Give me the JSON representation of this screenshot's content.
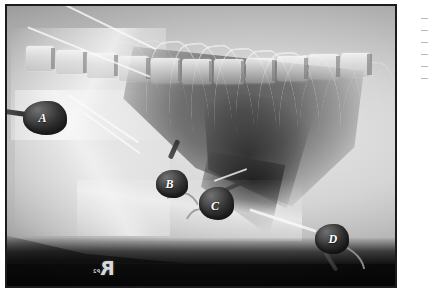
{
  "figure": {
    "kind": "radiograph",
    "modality": "x-ray",
    "view": "right lateral thorax",
    "species_hint": "canine"
  },
  "frame": {
    "border_color": "#1c1c1c",
    "page_background": "#ffffff"
  },
  "film": {
    "background_color": "#070707",
    "soft_tissue_color": "#c8c8c8",
    "lung_color": "#4a4a4a",
    "bone_color": "#f6f6f6"
  },
  "laterality_marker": {
    "letter": "R",
    "sub_text": "P2",
    "mirrored": true,
    "color": "#d8d8d8"
  },
  "annotations": [
    {
      "id": "marker-a",
      "letter": "A",
      "left_pct": 4.0,
      "top_pct": 34.0,
      "blob_w": 44,
      "blob_h": 34,
      "glyph_left": 16,
      "glyph_top": 11,
      "tail_left": -18,
      "tail_top": 8,
      "tail_w": 22,
      "tail_h": 5,
      "tail_rot": 8
    },
    {
      "id": "marker-b",
      "letter": "B",
      "left_pct": 38.5,
      "top_pct": 58.5,
      "blob_w": 32,
      "blob_h": 28,
      "glyph_left": 9,
      "glyph_top": 8,
      "tail_left": 14,
      "tail_top": -14,
      "tail_w": 20,
      "tail_h": 5,
      "tail_rot": -66
    },
    {
      "id": "marker-c",
      "letter": "C",
      "left_pct": 49.5,
      "top_pct": 64.5,
      "blob_w": 35,
      "blob_h": 33,
      "glyph_left": 12,
      "glyph_top": 13,
      "tail_left": 24,
      "tail_top": 2,
      "tail_w": 26,
      "tail_h": 4,
      "tail_rot": -24
    },
    {
      "id": "marker-d",
      "letter": "D",
      "left_pct": 79.5,
      "top_pct": 78.0,
      "blob_w": 34,
      "blob_h": 30,
      "glyph_left": 13,
      "glyph_top": 9,
      "tail_left": 10,
      "tail_top": 26,
      "tail_w": 22,
      "tail_h": 4,
      "tail_rot": 58
    }
  ],
  "right_column_sliver": {
    "line_count": 6,
    "line_color": "#b9b9b9",
    "line_tops": [
      18,
      30,
      42,
      54,
      66,
      78
    ]
  },
  "vertebrae": [
    {
      "left_pct": 3,
      "top_pct": 36,
      "w_pct": 7.5,
      "h_pct": 26
    },
    {
      "left_pct": 11,
      "top_pct": 40,
      "w_pct": 8.0,
      "h_pct": 26
    },
    {
      "left_pct": 19.5,
      "top_pct": 44,
      "w_pct": 8.0,
      "h_pct": 26
    },
    {
      "left_pct": 28,
      "top_pct": 47,
      "w_pct": 8.0,
      "h_pct": 26
    },
    {
      "left_pct": 36.5,
      "top_pct": 49,
      "w_pct": 8.0,
      "h_pct": 26
    },
    {
      "left_pct": 45,
      "top_pct": 50,
      "w_pct": 8.0,
      "h_pct": 26
    },
    {
      "left_pct": 53.5,
      "top_pct": 50,
      "w_pct": 8.0,
      "h_pct": 26
    },
    {
      "left_pct": 62,
      "top_pct": 49,
      "w_pct": 8.0,
      "h_pct": 26
    },
    {
      "left_pct": 70.5,
      "top_pct": 47,
      "w_pct": 8.0,
      "h_pct": 26
    },
    {
      "left_pct": 79,
      "top_pct": 45,
      "w_pct": 8.0,
      "h_pct": 26
    },
    {
      "left_pct": 87.5,
      "top_pct": 43,
      "w_pct": 8.0,
      "h_pct": 26
    }
  ],
  "ribs": [
    {
      "left_pct": 34,
      "top_pct": 10,
      "w_pct": 16,
      "h_pct": 68,
      "rot": -6,
      "thin": false
    },
    {
      "left_pct": 40,
      "top_pct": 11,
      "w_pct": 16,
      "h_pct": 70,
      "rot": -6,
      "thin": false
    },
    {
      "left_pct": 46,
      "top_pct": 12,
      "w_pct": 16,
      "h_pct": 70,
      "rot": -5,
      "thin": false
    },
    {
      "left_pct": 52,
      "top_pct": 13,
      "w_pct": 16,
      "h_pct": 70,
      "rot": -4,
      "thin": false
    },
    {
      "left_pct": 58,
      "top_pct": 14,
      "w_pct": 16,
      "h_pct": 68,
      "rot": -3,
      "thin": false
    },
    {
      "left_pct": 64,
      "top_pct": 15,
      "w_pct": 16,
      "h_pct": 66,
      "rot": -2,
      "thin": false
    },
    {
      "left_pct": 70,
      "top_pct": 16,
      "w_pct": 16,
      "h_pct": 62,
      "rot": 0,
      "thin": false
    },
    {
      "left_pct": 76,
      "top_pct": 17,
      "w_pct": 16,
      "h_pct": 58,
      "rot": 2,
      "thin": true
    },
    {
      "left_pct": 82,
      "top_pct": 18,
      "w_pct": 15,
      "h_pct": 54,
      "rot": 4,
      "thin": true
    },
    {
      "left_pct": 88,
      "top_pct": 19,
      "w_pct": 14,
      "h_pct": 48,
      "rot": 6,
      "thin": true
    },
    {
      "left_pct": 28,
      "top_pct": 10,
      "w_pct": 16,
      "h_pct": 62,
      "rot": -8,
      "thin": true
    },
    {
      "left_pct": 22,
      "top_pct": 11,
      "w_pct": 15,
      "h_pct": 54,
      "rot": -10,
      "thin": true
    }
  ],
  "streaks": [
    {
      "left_pct": 14,
      "top_pct": 40,
      "w_pct": 22,
      "h_px": 2,
      "rot": 34
    },
    {
      "left_pct": 18,
      "top_pct": 45,
      "w_pct": 18,
      "h_px": 1.5,
      "rot": 36
    },
    {
      "left_pct": 62,
      "top_pct": 76,
      "w_pct": 18,
      "h_px": 2.5,
      "rot": 18
    },
    {
      "left_pct": 53,
      "top_pct": 60,
      "w_pct": 9,
      "h_px": 2,
      "rot": -20
    },
    {
      "left_pct": 4,
      "top_pct": 16,
      "w_pct": 34,
      "h_px": 1.5,
      "rot": 22
    },
    {
      "left_pct": 10,
      "top_pct": 6,
      "w_pct": 30,
      "h_px": 1.5,
      "rot": 26
    }
  ],
  "tubes": [
    {
      "left_pct": 37,
      "top_pct": 66,
      "w_pct": 12,
      "h_pct": 26,
      "rot": 12
    },
    {
      "left_pct": 45,
      "top_pct": 72,
      "w_pct": 10,
      "h_pct": 26,
      "rot": -8
    },
    {
      "left_pct": 80,
      "top_pct": 86,
      "w_pct": 12,
      "h_pct": 12,
      "rot": 40
    }
  ]
}
